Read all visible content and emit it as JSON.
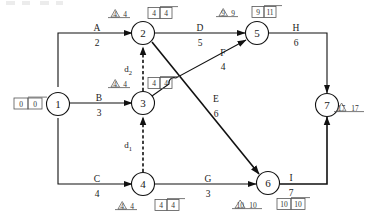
{
  "diagram": {
    "type": "aoa-network",
    "nodes": [
      {
        "id": "1",
        "label": "1",
        "x": 58,
        "y": 104,
        "box": {
          "left": "0",
          "right": "0"
        },
        "triangle": null,
        "tri_text": null
      },
      {
        "id": "2",
        "label": "2",
        "x": 143,
        "y": 33,
        "box": {
          "left": "4",
          "right": "4"
        },
        "triangle": "4",
        "tri_text": "4"
      },
      {
        "id": "3",
        "label": "3",
        "x": 143,
        "y": 103,
        "box": {
          "left": "4",
          "right": "4"
        },
        "triangle": "4",
        "tri_text": "4"
      },
      {
        "id": "4",
        "label": "4",
        "x": 143,
        "y": 184,
        "box": {
          "left": "4",
          "right": "4"
        },
        "triangle": "4",
        "tri_text": "4"
      },
      {
        "id": "5",
        "label": "5",
        "x": 257,
        "y": 33,
        "box": {
          "left": "9",
          "right": "11"
        },
        "triangle": "9",
        "tri_text": "9"
      },
      {
        "id": "6",
        "label": "6",
        "x": 268,
        "y": 183,
        "box": {
          "left": "10",
          "right": "10"
        },
        "triangle": "10",
        "tri_text": "10"
      },
      {
        "id": "7",
        "label": "7",
        "x": 327,
        "y": 105,
        "box": null,
        "triangle": "17",
        "tri_text": "17"
      }
    ],
    "edges": [
      {
        "id": "A",
        "name": "A",
        "duration": "2",
        "from": "1",
        "to": "2",
        "style": "solid"
      },
      {
        "id": "B",
        "name": "B",
        "duration": "3",
        "from": "1",
        "to": "3",
        "style": "solid"
      },
      {
        "id": "C",
        "name": "C",
        "duration": "4",
        "from": "1",
        "to": "4",
        "style": "solid"
      },
      {
        "id": "D",
        "name": "D",
        "duration": "5",
        "from": "2",
        "to": "5",
        "style": "solid"
      },
      {
        "id": "F",
        "name": "F",
        "duration": "4",
        "from": "3",
        "to": "5",
        "style": "solid"
      },
      {
        "id": "E",
        "name": "E",
        "duration": "6",
        "from": "2",
        "to": "6",
        "style": "solid"
      },
      {
        "id": "G",
        "name": "G",
        "duration": "3",
        "from": "4",
        "to": "6",
        "style": "solid"
      },
      {
        "id": "H",
        "name": "H",
        "duration": "6",
        "from": "5",
        "to": "7",
        "style": "solid"
      },
      {
        "id": "I",
        "name": "I",
        "duration": "7",
        "from": "6",
        "to": "7",
        "style": "solid"
      },
      {
        "id": "d2",
        "name": "d",
        "subscript": "2",
        "duration": "",
        "from": "3",
        "to": "2",
        "style": "dashed"
      },
      {
        "id": "d1",
        "name": "d",
        "subscript": "1",
        "duration": "",
        "from": "4",
        "to": "3",
        "style": "dashed"
      }
    ],
    "colors": {
      "line": "#111111",
      "annotation": "#555555",
      "background": "#ffffff"
    }
  }
}
